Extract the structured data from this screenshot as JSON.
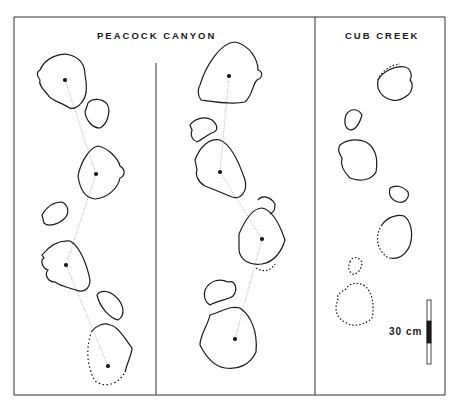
{
  "figure": {
    "panels": [
      {
        "id": "peacock-canyon",
        "title": "PEACOCK CANYON",
        "trackways": 2
      },
      {
        "id": "cub-creek",
        "title": "CUB CREEK",
        "trackways": 1
      }
    ],
    "scale_bar": {
      "label": "30 cm"
    },
    "colors": {
      "ink": "#1a1a1a",
      "background": "#ffffff",
      "frame": "#333333"
    }
  }
}
